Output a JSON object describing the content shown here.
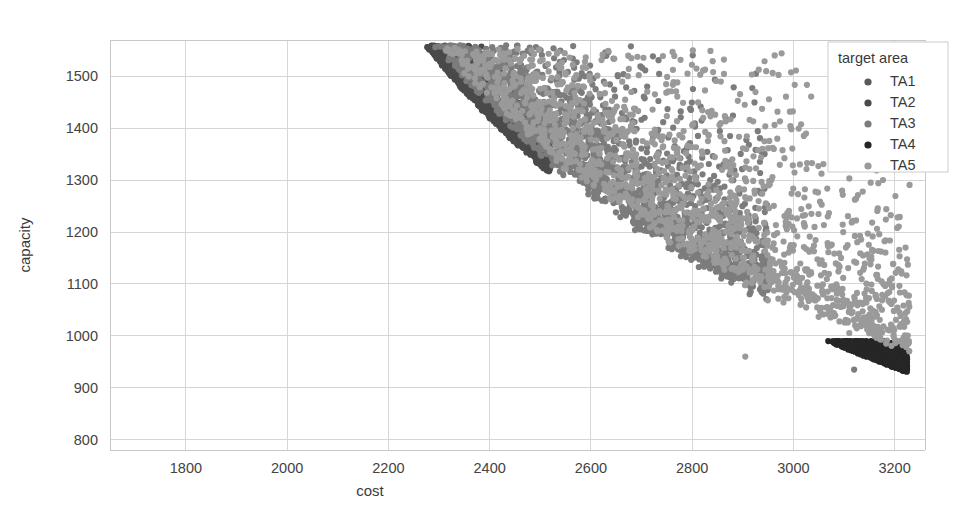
{
  "chart_data": {
    "type": "scatter",
    "title": "",
    "xlabel": "cost",
    "ylabel": "capacity",
    "xlim": [
      1650,
      3260
    ],
    "ylim": [
      780,
      1570
    ],
    "xticks": [
      1800,
      2000,
      2200,
      2400,
      2600,
      2800,
      3000,
      3200
    ],
    "xtick_labels": [
      "1800",
      "2000",
      "2200",
      "2400",
      "2600",
      "2800",
      "3000",
      "3200"
    ],
    "yticks": [
      800,
      900,
      1000,
      1100,
      1200,
      1300,
      1400,
      1500
    ],
    "ytick_labels": [
      "800",
      "900",
      "1000",
      "1100",
      "1200",
      "1300",
      "1400",
      "1500"
    ],
    "grid": true,
    "grid_color": "#d6d6d6",
    "background": "#ffffff",
    "legend": {
      "title": "target area",
      "position": "upper-right",
      "entries": [
        {
          "label": "TA1",
          "color": "#595959",
          "marker": "circle"
        },
        {
          "label": "TA2",
          "color": "#4a4a4a",
          "marker": "circle"
        },
        {
          "label": "TA3",
          "color": "#7c7c7c",
          "marker": "circle"
        },
        {
          "label": "TA4",
          "color": "#262626",
          "marker": "circle"
        },
        {
          "label": "TA5",
          "color": "#9a9a9a",
          "marker": "circle"
        }
      ]
    },
    "series": [
      {
        "name": "TA1",
        "color": "#595959",
        "n_points": 1500,
        "cost_range": [
          1690,
          2180
        ],
        "capacity_range": [
          1090,
          1565
        ],
        "front_band_offset": [
          0,
          95
        ],
        "seed": 11
      },
      {
        "name": "TA2",
        "color": "#4a4a4a",
        "n_points": 1400,
        "cost_range": [
          1700,
          2520
        ],
        "capacity_range": [
          960,
          1560
        ],
        "front_band_offset": [
          0,
          60
        ],
        "seed": 23
      },
      {
        "name": "TA3",
        "color": "#7c7c7c",
        "n_points": 1700,
        "cost_range": [
          1760,
          2950
        ],
        "capacity_range": [
          900,
          1560
        ],
        "front_band_offset": [
          25,
          260
        ],
        "seed": 37
      },
      {
        "name": "TA4",
        "color": "#262626",
        "n_points": 1300,
        "cost_range": [
          2480,
          3225
        ],
        "capacity_range": [
          820,
          990
        ],
        "front_band_offset": [
          0,
          45
        ],
        "seed": 53
      },
      {
        "name": "TA5",
        "color": "#9a9a9a",
        "n_points": 1600,
        "cost_range": [
          1840,
          3230
        ],
        "capacity_range": [
          860,
          1555
        ],
        "front_band_offset": [
          40,
          340
        ],
        "seed": 71
      }
    ],
    "frontier_curve": {
      "note": "lower boundary of the point cloud, capacity = a/(cost-b) + c",
      "a": 1480000,
      "b": 1180,
      "c": 210
    },
    "marker_size_px": 3.1,
    "outliers": [
      {
        "cost": 3198,
        "capacity": 1002,
        "series": "TA5"
      },
      {
        "cost": 3120,
        "capacity": 935,
        "series": "TA3"
      },
      {
        "cost": 2905,
        "capacity": 960,
        "series": "TA5"
      }
    ]
  },
  "axes": {
    "x_title": "cost",
    "y_title": "capacity"
  }
}
